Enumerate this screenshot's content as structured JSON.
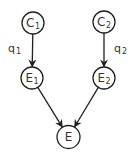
{
  "diagram": {
    "type": "directed-graph",
    "nodes": [
      {
        "id": "C1",
        "label": "C",
        "subscript": "1"
      },
      {
        "id": "C2",
        "label": "C",
        "subscript": "2"
      },
      {
        "id": "E1",
        "label": "E",
        "subscript": "1"
      },
      {
        "id": "E2",
        "label": "E",
        "subscript": "2"
      },
      {
        "id": "E",
        "label": "E",
        "subscript": ""
      }
    ],
    "edges": [
      {
        "from": "C1",
        "to": "E1",
        "label": "q",
        "subscript": "1"
      },
      {
        "from": "C2",
        "to": "E2",
        "label": "q",
        "subscript": "2"
      },
      {
        "from": "E1",
        "to": "E",
        "label": "",
        "subscript": ""
      },
      {
        "from": "E2",
        "to": "E",
        "label": "",
        "subscript": ""
      }
    ],
    "colors": {
      "stroke": "#222222",
      "text": "#333333",
      "background": "#ffffff"
    }
  }
}
